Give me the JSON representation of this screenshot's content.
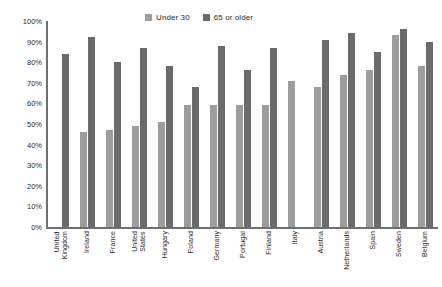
{
  "chart_data": {
    "type": "bar",
    "title": "",
    "xlabel": "",
    "ylabel": "",
    "ylim": [
      0,
      100
    ],
    "grid": false,
    "legend_position": "top-center",
    "ytick_labels": [
      "100%",
      "90%",
      "80%",
      "70%",
      "60%",
      "50%",
      "40%",
      "30%",
      "20%",
      "10%",
      "0%"
    ],
    "ytick_values": [
      100,
      90,
      80,
      70,
      60,
      50,
      40,
      30,
      20,
      10,
      0
    ],
    "categories": [
      "United Kingdom",
      "Ireland",
      "France",
      "United States",
      "Hungary",
      "Poland",
      "Germany",
      "Portugal",
      "Finland",
      "Italy",
      "Austria",
      "Netherlands",
      "Spain",
      "Sweden",
      "Belgium"
    ],
    "series": [
      {
        "name": "Under 30",
        "color": "#9d9d9d",
        "values": [
          null,
          46,
          47,
          49,
          51,
          59,
          59,
          59,
          59,
          71,
          68,
          74,
          76,
          93,
          78
        ]
      },
      {
        "name": "65 or older",
        "color": "#6b6b6b",
        "values": [
          84,
          92,
          80,
          87,
          78,
          68,
          88,
          76,
          87,
          null,
          91,
          94,
          85,
          96,
          90
        ]
      }
    ]
  },
  "legend": {
    "entries": [
      {
        "label": "Under 30",
        "color": "#9d9d9d",
        "swatch_name": "legend-swatch-under-30"
      },
      {
        "label": "65 or older",
        "color": "#6b6b6b",
        "swatch_name": "legend-swatch-65-or-older"
      }
    ]
  },
  "axes": {
    "y_axis_color": "#6f6f6f",
    "x_axis_color": "#6f6f6f"
  }
}
